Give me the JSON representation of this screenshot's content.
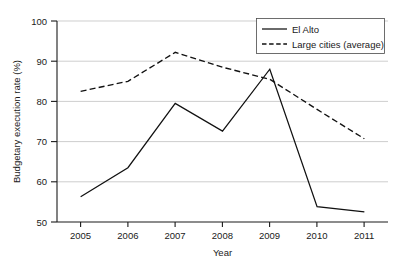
{
  "chart_data": {
    "type": "line",
    "title": "",
    "subtitle": "",
    "xlabel": "Year",
    "ylabel": "Budgetary execution rate (%)",
    "x": [
      2005,
      2006,
      2007,
      2008,
      2009,
      2010,
      2011
    ],
    "categories": [
      "2005",
      "2006",
      "2007",
      "2008",
      "2009",
      "2010",
      "2011"
    ],
    "xlim": [
      2004.5,
      2011.5
    ],
    "ylim": [
      50,
      100
    ],
    "yticks": [
      50,
      60,
      70,
      80,
      90,
      100
    ],
    "ytick_labels": [
      "50",
      "60",
      "70",
      "80",
      "90",
      "100"
    ],
    "xtick_labels": [
      "2005",
      "2006",
      "2007",
      "2008",
      "2009",
      "2010",
      "2011"
    ],
    "grid": "horizontal",
    "legend_position": "top-right",
    "series": [
      {
        "name": "El Alto",
        "style": "solid",
        "color": "#111111",
        "values": [
          56.3,
          63.5,
          79.5,
          72.6,
          88.0,
          53.8,
          52.5
        ]
      },
      {
        "name": "Large cities (average)",
        "style": "dashed",
        "color": "#111111",
        "values": [
          82.5,
          85.0,
          92.2,
          88.5,
          85.5,
          78.0,
          70.7
        ]
      }
    ],
    "annotations": []
  },
  "legend": {
    "items": [
      {
        "label": "El Alto"
      },
      {
        "label": "Large cities (average)"
      }
    ]
  },
  "axes": {
    "y_title": "Budgetary execution rate (%)",
    "x_title": "Year"
  }
}
